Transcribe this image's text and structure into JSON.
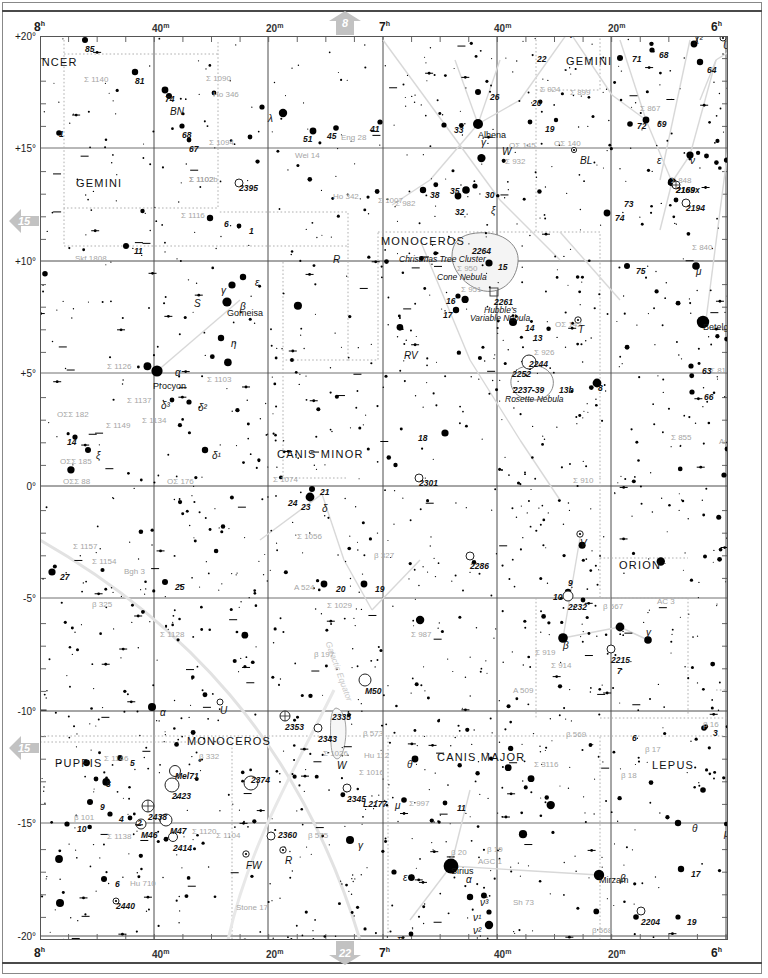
{
  "chart": {
    "type": "star-chart",
    "ra_axis": {
      "label_top": [
        "8h",
        "40m",
        "20m",
        "7h",
        "40m",
        "20m",
        "6h"
      ],
      "label_bottom": [
        "8h",
        "40m",
        "20m",
        "7h",
        "40m",
        "20m",
        "6h"
      ],
      "range_hours": [
        8.0,
        6.0
      ]
    },
    "dec_axis": {
      "labels": [
        "+20°",
        "+15°",
        "+10°",
        "+5°",
        "0°",
        "-5°",
        "-10°",
        "-15°",
        "-20°"
      ],
      "range_deg": [
        20,
        -20
      ]
    },
    "page_links": {
      "top": "8",
      "bottom": "22",
      "left_upper": "15",
      "left_lower": "15"
    }
  },
  "constellations": [
    {
      "name": "CANCER",
      "x": 24,
      "y": 56
    },
    {
      "name": "GEMINI",
      "x": 76,
      "y": 177
    },
    {
      "name": "GEMINI",
      "x": 566,
      "y": 55
    },
    {
      "name": "MONOCEROS",
      "x": 381,
      "y": 235
    },
    {
      "name": "CANIS MINOR",
      "x": 277,
      "y": 448
    },
    {
      "name": "ORION",
      "x": 619,
      "y": 559
    },
    {
      "name": "MONOCEROS",
      "x": 187,
      "y": 735
    },
    {
      "name": "PUPPIS",
      "x": 55,
      "y": 757
    },
    {
      "name": "CANIS MAJOR",
      "x": 437,
      "y": 751
    },
    {
      "name": "LEPUS",
      "x": 652,
      "y": 759
    }
  ],
  "named_stars": [
    {
      "name": "Alhena",
      "x": 478,
      "y": 130,
      "greek": "γ"
    },
    {
      "name": "Gomeisa",
      "x": 227,
      "y": 308,
      "greek": "β"
    },
    {
      "name": "Procyon",
      "x": 153,
      "y": 381,
      "greek": "α"
    },
    {
      "name": "Betelgeuse",
      "x": 703,
      "y": 322,
      "greek": "α"
    },
    {
      "name": "Sirius",
      "x": 451,
      "y": 866,
      "greek": "α"
    },
    {
      "name": "Mirzam",
      "x": 599,
      "y": 875,
      "greek": "β"
    }
  ],
  "nebulae": [
    {
      "label": "Christmas Tree Cluster",
      "x": 399,
      "y": 254
    },
    {
      "label": "Cone Nebula",
      "x": 437,
      "y": 272
    },
    {
      "label": "Hubble's",
      "x": 484,
      "y": 305
    },
    {
      "label": "Variable Nebula",
      "x": 470,
      "y": 313
    },
    {
      "label": "Rosette Nebula",
      "x": 505,
      "y": 394
    },
    {
      "label": "Galactic Equator",
      "x": 333,
      "y": 640
    }
  ],
  "deep_sky": [
    {
      "id": "2264",
      "x": 472,
      "y": 246
    },
    {
      "id": "2261",
      "x": 494,
      "y": 297
    },
    {
      "id": "2244",
      "x": 529,
      "y": 359
    },
    {
      "id": "2252",
      "x": 512,
      "y": 369
    },
    {
      "id": "2237-39",
      "x": 513,
      "y": 385
    },
    {
      "id": "2232",
      "x": 568,
      "y": 602
    },
    {
      "id": "2286",
      "x": 470,
      "y": 561
    },
    {
      "id": "2215",
      "x": 611,
      "y": 655
    },
    {
      "id": "2301",
      "x": 419,
      "y": 478
    },
    {
      "id": "2506",
      "x": 17,
      "y": 732
    },
    {
      "id": "2395",
      "x": 239,
      "y": 183
    },
    {
      "id": "2353",
      "x": 285,
      "y": 722
    },
    {
      "id": "2335",
      "x": 332,
      "y": 712
    },
    {
      "id": "2343",
      "x": 318,
      "y": 734
    },
    {
      "id": "2345",
      "x": 347,
      "y": 794
    },
    {
      "id": "2374",
      "x": 251,
      "y": 775
    },
    {
      "id": "2360",
      "x": 278,
      "y": 830
    },
    {
      "id": "2440",
      "x": 116,
      "y": 901
    },
    {
      "id": "2423",
      "x": 172,
      "y": 791
    },
    {
      "id": "2438",
      "x": 148,
      "y": 812
    },
    {
      "id": "2414",
      "x": 173,
      "y": 843
    },
    {
      "id": "M46",
      "x": 141,
      "y": 830
    },
    {
      "id": "M47",
      "x": 170,
      "y": 826
    },
    {
      "id": "M50",
      "x": 365,
      "y": 686
    },
    {
      "id": "Mel71",
      "x": 175,
      "y": 771
    },
    {
      "id": "2194",
      "x": 686,
      "y": 203
    },
    {
      "id": "2169",
      "x": 676,
      "y": 185
    },
    {
      "id": "2204",
      "x": 641,
      "y": 917
    },
    {
      "id": "L2177",
      "x": 363,
      "y": 799
    },
    {
      "id": "2169x",
      "x": 676,
      "y": 185
    }
  ],
  "gray_labels": [
    {
      "t": "Σ 1140",
      "x": 84,
      "y": 75
    },
    {
      "t": "Σ 1090",
      "x": 206,
      "y": 74
    },
    {
      "t": "Ho 346",
      "x": 213,
      "y": 90
    },
    {
      "t": "Σ 1094",
      "x": 209,
      "y": 138
    },
    {
      "t": "Wei 14",
      "x": 295,
      "y": 151
    },
    {
      "t": "Eng 28",
      "x": 341,
      "y": 133
    },
    {
      "t": "Σ 1102",
      "x": 189,
      "y": 175
    },
    {
      "t": "Σ 1116",
      "x": 181,
      "y": 211
    },
    {
      "t": "Ho 342",
      "x": 333,
      "y": 192
    },
    {
      "t": "Σ 1007",
      "x": 378,
      "y": 196
    },
    {
      "t": "Skf 1808",
      "x": 75,
      "y": 254
    },
    {
      "t": "Σ 950",
      "x": 457,
      "y": 264
    },
    {
      "t": "Σ 951",
      "x": 461,
      "y": 285
    },
    {
      "t": "Σ 926",
      "x": 534,
      "y": 348
    },
    {
      "t": "OΣ 142",
      "x": 555,
      "y": 320
    },
    {
      "t": "Σ 1126",
      "x": 107,
      "y": 362
    },
    {
      "t": "Σ 1103",
      "x": 207,
      "y": 375
    },
    {
      "t": "Σ 1137",
      "x": 127,
      "y": 396
    },
    {
      "t": "Σ 1134",
      "x": 142,
      "y": 416
    },
    {
      "t": "Σ 1149",
      "x": 106,
      "y": 421
    },
    {
      "t": "OΣΣ 182",
      "x": 57,
      "y": 410
    },
    {
      "t": "OΣΣ 185",
      "x": 60,
      "y": 457
    },
    {
      "t": "OΣΣ 88",
      "x": 63,
      "y": 477
    },
    {
      "t": "OΣ 176",
      "x": 167,
      "y": 477
    },
    {
      "t": "Σ 1074",
      "x": 273,
      "y": 475
    },
    {
      "t": "Σ 1056",
      "x": 297,
      "y": 532
    },
    {
      "t": "Σ 1157",
      "x": 73,
      "y": 542
    },
    {
      "t": "Σ 1154",
      "x": 92,
      "y": 557
    },
    {
      "t": "Bgh 3",
      "x": 124,
      "y": 567
    },
    {
      "t": "β 325",
      "x": 92,
      "y": 600
    },
    {
      "t": "Σ 1128",
      "x": 160,
      "y": 630
    },
    {
      "t": "β 197",
      "x": 314,
      "y": 650
    },
    {
      "t": "β 327",
      "x": 374,
      "y": 551
    },
    {
      "t": "A 524",
      "x": 294,
      "y": 583
    },
    {
      "t": "Σ 1029",
      "x": 327,
      "y": 601
    },
    {
      "t": "Σ 987",
      "x": 411,
      "y": 630
    },
    {
      "t": "A 509",
      "x": 513,
      "y": 686
    },
    {
      "t": "Σ 919",
      "x": 535,
      "y": 648
    },
    {
      "t": "Σ 914",
      "x": 551,
      "y": 661
    },
    {
      "t": "Σ 910",
      "x": 573,
      "y": 476
    },
    {
      "t": "Σ 855",
      "x": 671,
      "y": 433
    },
    {
      "t": "Σ 816",
      "x": 710,
      "y": 366
    },
    {
      "t": "Am 17",
      "x": 719,
      "y": 437
    },
    {
      "t": "β 567",
      "x": 603,
      "y": 602
    },
    {
      "t": "AC 3",
      "x": 657,
      "y": 597
    },
    {
      "t": "β 569",
      "x": 566,
      "y": 730
    },
    {
      "t": "β 16",
      "x": 703,
      "y": 720
    },
    {
      "t": "β 17",
      "x": 645,
      "y": 745
    },
    {
      "t": "β 18",
      "x": 621,
      "y": 771
    },
    {
      "t": "Σ 3116",
      "x": 534,
      "y": 760
    },
    {
      "t": "Σ 997",
      "x": 409,
      "y": 799
    },
    {
      "t": "β 19",
      "x": 487,
      "y": 845
    },
    {
      "t": "β 20",
      "x": 451,
      "y": 848
    },
    {
      "t": "AGC 1",
      "x": 478,
      "y": 857
    },
    {
      "t": "Sh 73",
      "x": 513,
      "y": 898
    },
    {
      "t": "β 568",
      "x": 592,
      "y": 926
    },
    {
      "t": "Σ 1146",
      "x": 104,
      "y": 754
    },
    {
      "t": "β 101",
      "x": 74,
      "y": 813
    },
    {
      "t": "Σ 1138",
      "x": 107,
      "y": 832
    },
    {
      "t": "Σ 1120",
      "x": 192,
      "y": 827
    },
    {
      "t": "Σ 1104",
      "x": 216,
      "y": 831
    },
    {
      "t": "Hu 710",
      "x": 130,
      "y": 879
    },
    {
      "t": "Stone 17",
      "x": 236,
      "y": 903
    },
    {
      "t": "β 332",
      "x": 199,
      "y": 752
    },
    {
      "t": "Σ 1026",
      "x": 323,
      "y": 749
    },
    {
      "t": "Σ 1016",
      "x": 359,
      "y": 768
    },
    {
      "t": "Hu 112",
      "x": 364,
      "y": 751
    },
    {
      "t": "β 573",
      "x": 363,
      "y": 729
    },
    {
      "t": "β 575",
      "x": 308,
      "y": 831
    },
    {
      "t": "Σ 924",
      "x": 540,
      "y": 85
    },
    {
      "t": "Σ 899",
      "x": 570,
      "y": 88
    },
    {
      "t": "OΣΣ 72",
      "x": 524,
      "y": 29
    },
    {
      "t": "OΣ 145",
      "x": 509,
      "y": 141
    },
    {
      "t": "OΣ 140",
      "x": 554,
      "y": 139
    },
    {
      "t": "Σ 932",
      "x": 505,
      "y": 157
    },
    {
      "t": "Σ 867",
      "x": 640,
      "y": 104
    },
    {
      "t": "Σ 848",
      "x": 671,
      "y": 176
    },
    {
      "t": "Σ 840",
      "x": 692,
      "y": 243
    },
    {
      "t": "OΣ 124",
      "x": 728,
      "y": 208
    },
    {
      "t": "Σ 982",
      "x": 395,
      "y": 199
    },
    {
      "t": "Σ 1102b",
      "x": 189,
      "y": 175
    }
  ],
  "star_numbers": [
    {
      "t": "85",
      "x": 85,
      "y": 44
    },
    {
      "t": "81",
      "x": 135,
      "y": 76
    },
    {
      "t": "74",
      "x": 165,
      "y": 94
    },
    {
      "t": "3",
      "x": 32,
      "y": 99
    },
    {
      "t": "1",
      "x": 59,
      "y": 129
    },
    {
      "t": "68",
      "x": 182,
      "y": 130
    },
    {
      "t": "67",
      "x": 189,
      "y": 144
    },
    {
      "t": "51",
      "x": 303,
      "y": 134
    },
    {
      "t": "45",
      "x": 327,
      "y": 131
    },
    {
      "t": "41",
      "x": 370,
      "y": 124
    },
    {
      "t": "6",
      "x": 224,
      "y": 219
    },
    {
      "t": "1",
      "x": 249,
      "y": 226
    },
    {
      "t": "11",
      "x": 134,
      "y": 246
    },
    {
      "t": "22",
      "x": 537,
      "y": 54
    },
    {
      "t": "26",
      "x": 490,
      "y": 92
    },
    {
      "t": "33",
      "x": 454,
      "y": 125
    },
    {
      "t": "20",
      "x": 532,
      "y": 98
    },
    {
      "t": "19",
      "x": 545,
      "y": 124
    },
    {
      "t": "71",
      "x": 632,
      "y": 54
    },
    {
      "t": "68",
      "x": 659,
      "y": 50
    },
    {
      "t": "64",
      "x": 707,
      "y": 65
    },
    {
      "t": "57",
      "x": 748,
      "y": 57
    },
    {
      "t": "72",
      "x": 637,
      "y": 121
    },
    {
      "t": "69",
      "x": 657,
      "y": 119
    },
    {
      "t": "73",
      "x": 624,
      "y": 199
    },
    {
      "t": "74",
      "x": 615,
      "y": 213
    },
    {
      "t": "38",
      "x": 430,
      "y": 190
    },
    {
      "t": "35",
      "x": 450,
      "y": 186
    },
    {
      "t": "30",
      "x": 485,
      "y": 190
    },
    {
      "t": "32",
      "x": 455,
      "y": 207
    },
    {
      "t": "15",
      "x": 498,
      "y": 262
    },
    {
      "t": "16",
      "x": 446,
      "y": 296
    },
    {
      "t": "17",
      "x": 443,
      "y": 310
    },
    {
      "t": "14",
      "x": 525,
      "y": 323
    },
    {
      "t": "13",
      "x": 533,
      "y": 333
    },
    {
      "t": "13b",
      "x": 559,
      "y": 385
    },
    {
      "t": "8",
      "x": 598,
      "y": 383
    },
    {
      "t": "75",
      "x": 636,
      "y": 266
    },
    {
      "t": "63",
      "x": 702,
      "y": 366
    },
    {
      "t": "66",
      "x": 704,
      "y": 392
    },
    {
      "t": "59",
      "x": 734,
      "y": 449
    },
    {
      "t": "60",
      "x": 735,
      "y": 475
    },
    {
      "t": "14",
      "x": 67,
      "y": 437
    },
    {
      "t": "18",
      "x": 418,
      "y": 433
    },
    {
      "t": "27",
      "x": 60,
      "y": 572
    },
    {
      "t": "25",
      "x": 175,
      "y": 582
    },
    {
      "t": "20",
      "x": 336,
      "y": 584
    },
    {
      "t": "19",
      "x": 375,
      "y": 584
    },
    {
      "t": "21",
      "x": 320,
      "y": 487
    },
    {
      "t": "24",
      "x": 288,
      "y": 498
    },
    {
      "t": "23",
      "x": 301,
      "y": 502
    },
    {
      "t": "9",
      "x": 568,
      "y": 578
    },
    {
      "t": "10",
      "x": 553,
      "y": 592
    },
    {
      "t": "7",
      "x": 617,
      "y": 666
    },
    {
      "t": "1",
      "x": 738,
      "y": 690
    },
    {
      "t": "2",
      "x": 738,
      "y": 702
    },
    {
      "t": "6",
      "x": 632,
      "y": 733
    },
    {
      "t": "3",
      "x": 713,
      "y": 728
    },
    {
      "t": "5",
      "x": 130,
      "y": 758
    },
    {
      "t": "8",
      "x": 106,
      "y": 779
    },
    {
      "t": "9",
      "x": 100,
      "y": 802
    },
    {
      "t": "10",
      "x": 77,
      "y": 824
    },
    {
      "t": "4",
      "x": 119,
      "y": 814
    },
    {
      "t": "2",
      "x": 137,
      "y": 818
    },
    {
      "t": "6",
      "x": 115,
      "y": 879
    },
    {
      "t": "11",
      "x": 457,
      "y": 803
    },
    {
      "t": "17",
      "x": 691,
      "y": 869
    },
    {
      "t": "19",
      "x": 687,
      "y": 917
    },
    {
      "t": "15",
      "x": 434,
      "y": 946
    },
    {
      "t": "17",
      "x": 404,
      "y": 949
    }
  ],
  "greek_labels": [
    {
      "t": "λ",
      "x": 268,
      "y": 113
    },
    {
      "t": "ε",
      "x": 255,
      "y": 277
    },
    {
      "t": "γ",
      "x": 221,
      "y": 285
    },
    {
      "t": "β",
      "x": 240,
      "y": 301
    },
    {
      "t": "η",
      "x": 231,
      "y": 338
    },
    {
      "t": "α",
      "x": 175,
      "y": 367
    },
    {
      "t": "δ³",
      "x": 161,
      "y": 400
    },
    {
      "t": "δ²",
      "x": 198,
      "y": 402
    },
    {
      "t": "δ¹",
      "x": 212,
      "y": 450
    },
    {
      "t": "ξ",
      "x": 96,
      "y": 450
    },
    {
      "t": "δ",
      "x": 322,
      "y": 503
    },
    {
      "t": "γ",
      "x": 481,
      "y": 137
    },
    {
      "t": "ξ",
      "x": 491,
      "y": 205
    },
    {
      "t": "ν",
      "x": 569,
      "y": 29
    },
    {
      "t": "ν",
      "x": 690,
      "y": 155
    },
    {
      "t": "μ",
      "x": 696,
      "y": 266
    },
    {
      "t": "α",
      "x": 744,
      "y": 338
    },
    {
      "t": "β",
      "x": 563,
      "y": 640
    },
    {
      "t": "γ",
      "x": 646,
      "y": 627
    },
    {
      "t": "α",
      "x": 160,
      "y": 707
    },
    {
      "t": "α",
      "x": 466,
      "y": 874
    },
    {
      "t": "β",
      "x": 620,
      "y": 873
    },
    {
      "t": "γ",
      "x": 358,
      "y": 840
    },
    {
      "t": "θ",
      "x": 407,
      "y": 759
    },
    {
      "t": "μ",
      "x": 395,
      "y": 800
    },
    {
      "t": "ε",
      "x": 403,
      "y": 872
    },
    {
      "t": "ν³",
      "x": 480,
      "y": 897
    },
    {
      "t": "ν¹",
      "x": 473,
      "y": 912
    },
    {
      "t": "ν²",
      "x": 473,
      "y": 925
    },
    {
      "t": "π",
      "x": 397,
      "y": 934
    },
    {
      "t": "η",
      "x": 731,
      "y": 808
    },
    {
      "t": "θ",
      "x": 692,
      "y": 823
    },
    {
      "t": "μ",
      "x": 724,
      "y": 828
    },
    {
      "t": "χ²",
      "x": 694,
      "y": 33
    },
    {
      "t": "χ¹",
      "x": 750,
      "y": 33
    },
    {
      "t": "υ",
      "x": 739,
      "y": 40
    },
    {
      "t": "ε",
      "x": 657,
      "y": 155
    },
    {
      "t": "W",
      "x": 502,
      "y": 146
    },
    {
      "t": "W",
      "x": 337,
      "y": 760
    },
    {
      "t": "BL",
      "x": 580,
      "y": 155
    },
    {
      "t": "T",
      "x": 578,
      "y": 324
    },
    {
      "t": "RV",
      "x": 404,
      "y": 350
    },
    {
      "t": "V",
      "x": 580,
      "y": 538
    },
    {
      "t": "U",
      "x": 220,
      "y": 705
    },
    {
      "t": "U",
      "x": 723,
      "y": 40
    },
    {
      "t": "R",
      "x": 333,
      "y": 254
    },
    {
      "t": "R",
      "x": 285,
      "y": 855
    },
    {
      "t": "FW",
      "x": 246,
      "y": 860
    },
    {
      "t": "BN",
      "x": 170,
      "y": 106
    },
    {
      "t": "S",
      "x": 194,
      "y": 298
    }
  ]
}
